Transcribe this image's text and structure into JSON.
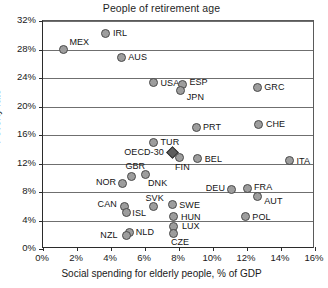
{
  "chart_data": {
    "type": "scatter",
    "title": "People of retirement age",
    "xlabel": "Social spending for elderly people, % of GDP",
    "ylabel": "Poverty rate",
    "xlim": [
      0,
      16
    ],
    "ylim": [
      0,
      32
    ],
    "xticks": [
      "0%",
      "2%",
      "4%",
      "6%",
      "8%",
      "10%",
      "12%",
      "14%",
      "16%"
    ],
    "xtick_values": [
      0,
      2,
      4,
      6,
      8,
      10,
      12,
      14,
      16
    ],
    "yticks": [
      "0%",
      "4%",
      "8%",
      "12%",
      "16%",
      "20%",
      "24%",
      "28%",
      "32%"
    ],
    "ytick_values": [
      0,
      4,
      8,
      12,
      16,
      20,
      24,
      28,
      32
    ],
    "grid": "horizontal",
    "legend": "none",
    "points": [
      {
        "label": "MEX",
        "x": 1.2,
        "y": 28.0,
        "marker": "circle",
        "lx": 6,
        "ly": -13
      },
      {
        "label": "IRL",
        "x": 3.7,
        "y": 30.3,
        "marker": "circle",
        "lx": 7,
        "ly": -5
      },
      {
        "label": "AUS",
        "x": 4.6,
        "y": 26.9,
        "marker": "circle",
        "lx": 7,
        "ly": -5
      },
      {
        "label": "USA",
        "x": 6.5,
        "y": 23.4,
        "marker": "circle",
        "lx": 7,
        "ly": -4
      },
      {
        "label": "ESP",
        "x": 8.2,
        "y": 23.1,
        "marker": "circle",
        "lx": 7,
        "ly": -7
      },
      {
        "label": "JPN",
        "x": 8.1,
        "y": 22.2,
        "marker": "circle",
        "lx": 6,
        "ly": 1
      },
      {
        "label": "GRC",
        "x": 12.6,
        "y": 22.7,
        "marker": "circle",
        "lx": 7,
        "ly": -5
      },
      {
        "label": "PRT",
        "x": 9.0,
        "y": 17.0,
        "marker": "circle",
        "lx": 7,
        "ly": -6
      },
      {
        "label": "CHE",
        "x": 12.7,
        "y": 17.5,
        "marker": "circle",
        "lx": 7,
        "ly": -5
      },
      {
        "label": "TUR",
        "x": 6.5,
        "y": 15.0,
        "marker": "circle",
        "lx": 7,
        "ly": -5
      },
      {
        "label": "OECD-30",
        "x": 7.6,
        "y": 13.5,
        "marker": "diamond",
        "lx": -48,
        "ly": -6
      },
      {
        "label": "FIN",
        "x": 8.0,
        "y": 12.8,
        "marker": "circle",
        "lx": -4,
        "ly": 4
      },
      {
        "label": "BEL",
        "x": 9.1,
        "y": 12.7,
        "marker": "circle",
        "lx": 7,
        "ly": -5
      },
      {
        "label": "ITA",
        "x": 14.5,
        "y": 12.4,
        "marker": "circle",
        "lx": 7,
        "ly": -5
      },
      {
        "label": "GBR",
        "x": 5.2,
        "y": 10.2,
        "marker": "circle",
        "lx": -6,
        "ly": -15
      },
      {
        "label": "DNK",
        "x": 6.0,
        "y": 10.4,
        "marker": "circle",
        "lx": 3,
        "ly": 3
      },
      {
        "label": "NOR",
        "x": 4.7,
        "y": 9.2,
        "marker": "circle",
        "lx": -27,
        "ly": -6
      },
      {
        "label": "DEU",
        "x": 11.1,
        "y": 8.4,
        "marker": "circle",
        "lx": -26,
        "ly": -6
      },
      {
        "label": "FRA",
        "x": 12.0,
        "y": 8.5,
        "marker": "circle",
        "lx": 7,
        "ly": -6
      },
      {
        "label": "AUT",
        "x": 12.6,
        "y": 7.3,
        "marker": "circle",
        "lx": 7,
        "ly": -1
      },
      {
        "label": "CAN",
        "x": 4.8,
        "y": 6.0,
        "marker": "circle",
        "lx": -27,
        "ly": -7
      },
      {
        "label": "ISL",
        "x": 4.9,
        "y": 5.1,
        "marker": "circle",
        "lx": 6,
        "ly": 0
      },
      {
        "label": "SVK",
        "x": 6.5,
        "y": 5.9,
        "marker": "circle",
        "lx": -8,
        "ly": -14
      },
      {
        "label": "SWE",
        "x": 7.6,
        "y": 6.2,
        "marker": "circle",
        "lx": 7,
        "ly": -5
      },
      {
        "label": "HUN",
        "x": 7.7,
        "y": 4.6,
        "marker": "circle",
        "lx": 7,
        "ly": -4
      },
      {
        "label": "POL",
        "x": 11.9,
        "y": 4.6,
        "marker": "circle",
        "lx": 7,
        "ly": -4
      },
      {
        "label": "LUX",
        "x": 7.7,
        "y": 3.1,
        "marker": "circle",
        "lx": 8,
        "ly": -6
      },
      {
        "label": "CZE",
        "x": 7.7,
        "y": 2.2,
        "marker": "circle",
        "lx": -3,
        "ly": 4
      },
      {
        "label": "NLD",
        "x": 5.1,
        "y": 2.3,
        "marker": "circle",
        "lx": 6,
        "ly": -6
      },
      {
        "label": "NZL",
        "x": 4.9,
        "y": 1.9,
        "marker": "circle",
        "lx": -26,
        "ly": 0
      }
    ]
  },
  "colors": {
    "marker_fill": "#9d9d9d",
    "marker_stroke": "#4a4a4a",
    "highlight_fill": "#5d5d5d",
    "grid": "#6f6f6f",
    "axis": "#2b2b2b",
    "background": "#ffffff",
    "text": "#1a1a1a"
  }
}
